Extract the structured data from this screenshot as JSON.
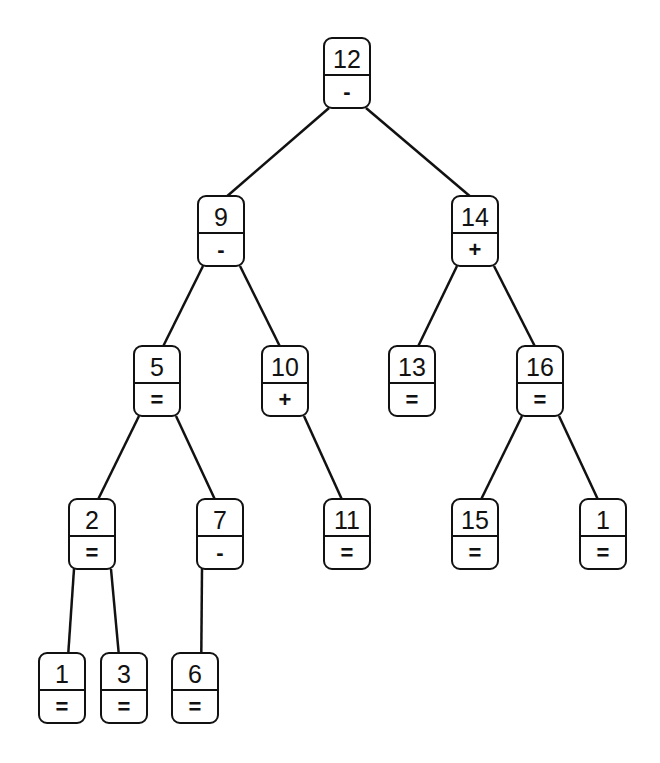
{
  "diagram": {
    "type": "binary-search-tree",
    "line_color": "#111111",
    "nodes": [
      {
        "id": "n12",
        "key": "12",
        "balance": "-",
        "x": 323,
        "y": 37
      },
      {
        "id": "n9",
        "key": "9",
        "balance": "-",
        "x": 197,
        "y": 195
      },
      {
        "id": "n14",
        "key": "14",
        "balance": "+",
        "x": 451,
        "y": 195
      },
      {
        "id": "n5",
        "key": "5",
        "balance": "=",
        "x": 133,
        "y": 345
      },
      {
        "id": "n10",
        "key": "10",
        "balance": "+",
        "x": 261,
        "y": 345
      },
      {
        "id": "n13",
        "key": "13",
        "balance": "=",
        "x": 388,
        "y": 345
      },
      {
        "id": "n16",
        "key": "16",
        "balance": "=",
        "x": 516,
        "y": 345
      },
      {
        "id": "n2",
        "key": "2",
        "balance": "=",
        "x": 68,
        "y": 498
      },
      {
        "id": "n7",
        "key": "7",
        "balance": "-",
        "x": 196,
        "y": 498
      },
      {
        "id": "n11",
        "key": "11",
        "balance": "=",
        "x": 323,
        "y": 498
      },
      {
        "id": "n15",
        "key": "15",
        "balance": "=",
        "x": 451,
        "y": 498
      },
      {
        "id": "n1b",
        "key": "1",
        "balance": "=",
        "x": 579,
        "y": 498
      },
      {
        "id": "n1",
        "key": "1",
        "balance": "=",
        "x": 38,
        "y": 652
      },
      {
        "id": "n3",
        "key": "3",
        "balance": "=",
        "x": 100,
        "y": 652
      },
      {
        "id": "n6",
        "key": "6",
        "balance": "=",
        "x": 171,
        "y": 652
      }
    ],
    "edges": [
      [
        "n12",
        "n9"
      ],
      [
        "n12",
        "n14"
      ],
      [
        "n9",
        "n5"
      ],
      [
        "n9",
        "n10"
      ],
      [
        "n14",
        "n13"
      ],
      [
        "n14",
        "n16"
      ],
      [
        "n5",
        "n2"
      ],
      [
        "n5",
        "n7"
      ],
      [
        "n10",
        "n11"
      ],
      [
        "n16",
        "n15"
      ],
      [
        "n16",
        "n1b"
      ],
      [
        "n2",
        "n1"
      ],
      [
        "n2",
        "n3"
      ],
      [
        "n7",
        "n6"
      ]
    ]
  }
}
